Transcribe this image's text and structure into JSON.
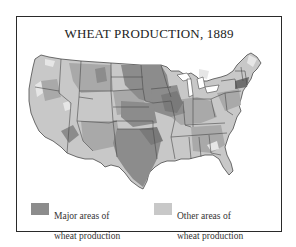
{
  "title": "WHEAT PRODUCTION, 1889",
  "colors": {
    "major": "#8c8c8c",
    "other": "#c8c8c8",
    "base": "#a9a9a9",
    "light": "#e4e4e4",
    "border": "#4a4a4a",
    "frame": "#2a2a2a"
  },
  "legend": {
    "major": {
      "line1": "Major areas of",
      "line2": "wheat production"
    },
    "other": {
      "line1": "Other areas of",
      "line2": "wheat production"
    }
  }
}
